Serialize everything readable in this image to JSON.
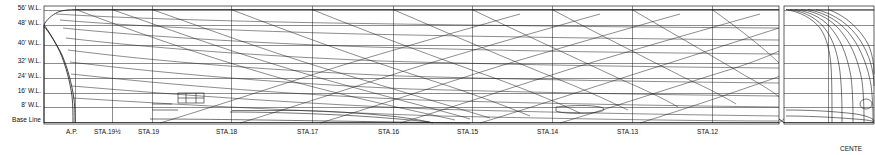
{
  "drawing": {
    "title_fragment": "CENTE",
    "waterline_labels": [
      {
        "text": "56' W.L.",
        "y": 7
      },
      {
        "text": "48' W.L.",
        "y": 22
      },
      {
        "text": "40' W.L.",
        "y": 42
      },
      {
        "text": "32' W.L.",
        "y": 60
      },
      {
        "text": "24' W.L.",
        "y": 75
      },
      {
        "text": "16' W.L.",
        "y": 90
      },
      {
        "text": "8' W.L.",
        "y": 104
      },
      {
        "text": "Base Line",
        "y": 119
      }
    ],
    "station_labels": [
      {
        "text": "A.P.",
        "x": 68
      },
      {
        "text": "STA.19½",
        "x": 98
      },
      {
        "text": "STA.19",
        "x": 142
      },
      {
        "text": "STA.18",
        "x": 218
      },
      {
        "text": "STA.17",
        "x": 302
      },
      {
        "text": "STA.16",
        "x": 383
      },
      {
        "text": "STA.15",
        "x": 461
      },
      {
        "text": "STA.14",
        "x": 540
      },
      {
        "text": "STA.13",
        "x": 622
      },
      {
        "text": "STA.12",
        "x": 702
      }
    ],
    "colors": {
      "line": "#1a1a1a",
      "background": "#ffffff",
      "text": "#111111"
    }
  }
}
